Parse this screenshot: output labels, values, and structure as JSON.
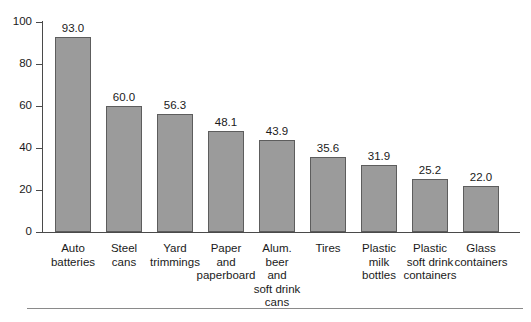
{
  "chart_data": {
    "type": "bar",
    "title": "",
    "subtitle": "",
    "xlabel": "",
    "ylabel": "",
    "ylim": [
      0,
      100
    ],
    "yticks": [
      0,
      20,
      40,
      60,
      80,
      100
    ],
    "ytick_labels": [
      "0",
      "20",
      "40",
      "60",
      "80",
      "100"
    ],
    "grid": false,
    "legend": null,
    "categories": [
      "Auto\nbatteries",
      "Steel\ncans",
      "Yard\ntrimmings",
      "Paper\nand\npaperboard",
      "Alum.\nbeer\nand\nsoft drink\ncans",
      "Tires",
      "Plastic\nmilk\nbottles",
      "Plastic\nsoft drink\ncontainers",
      "Glass\ncontainers"
    ],
    "values": [
      93.0,
      60.0,
      56.3,
      48.1,
      43.9,
      35.6,
      31.9,
      25.2,
      22.0
    ],
    "value_labels": [
      "93.0",
      "60.0",
      "56.3",
      "48.1",
      "43.9",
      "35.6",
      "31.9",
      "25.2",
      "22.0"
    ],
    "colors": {
      "bar_fill": "#9b9b9b",
      "bar_border": "#5d5d5d",
      "axis": "#4a4a4a",
      "text": "#1a1a1a",
      "background": "#ffffff",
      "rule": "#8a8a8a"
    }
  }
}
